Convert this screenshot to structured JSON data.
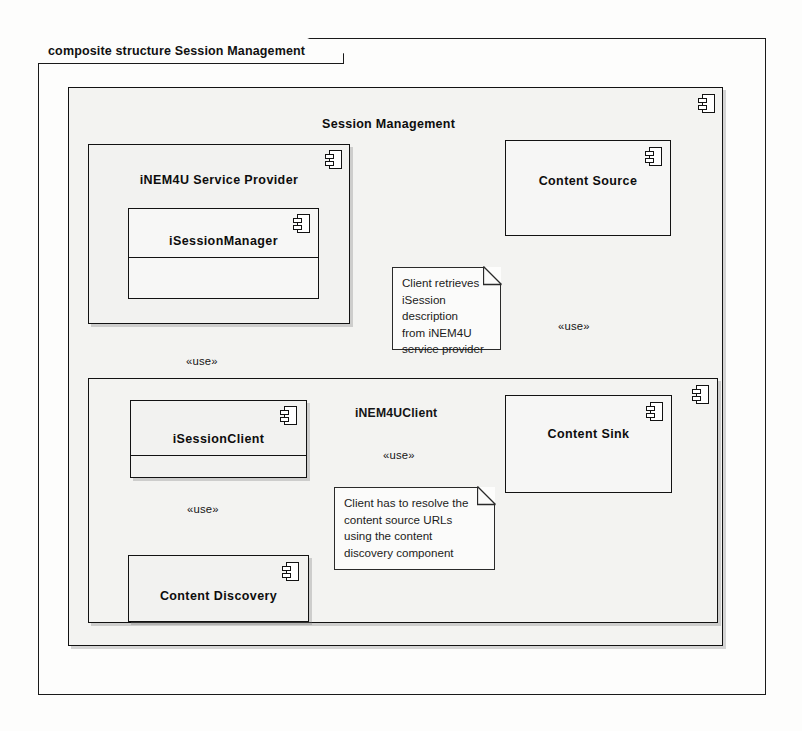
{
  "diagram": {
    "frame_label": "composite structure Session Management",
    "type": "uml-composite-structure"
  },
  "containers": [
    {
      "id": "session-management",
      "label": "Session Management",
      "icon": "component-icon"
    },
    {
      "id": "inem4u-client-container",
      "label": "",
      "icon": "component-icon"
    }
  ],
  "components": [
    {
      "id": "inem4u-service-provider",
      "label": "iNEM4U Service Provider",
      "icon": "component-icon"
    },
    {
      "id": "isession-manager",
      "label": "iSessionManager",
      "icon": "component-icon"
    },
    {
      "id": "content-source",
      "label": "Content Source",
      "icon": "component-icon"
    },
    {
      "id": "isession-client",
      "label": "iSessionClient",
      "icon": "component-icon"
    },
    {
      "id": "content-sink",
      "label": "Content Sink",
      "icon": "component-icon"
    },
    {
      "id": "content-discovery",
      "label": "Content Discovery",
      "icon": "component-icon"
    }
  ],
  "edges": {
    "use_provider": "«use»",
    "use_source": "«use»",
    "use_sink": "«use»",
    "use_discovery": "«use»",
    "inem4u_client": "iNEM4UClient"
  },
  "notes": [
    {
      "id": "note-session-description",
      "text": "Client retrieves\niSession description\nfrom iNEM4U\nservice provider"
    },
    {
      "id": "note-content-discovery",
      "text": "Client has to resolve the\ncontent source URLs\nusing the content\ndiscovery component"
    }
  ],
  "colors": {
    "stroke": "#121212",
    "component_fill": "#f2f2f0",
    "canvas": "#fdfdfc"
  }
}
